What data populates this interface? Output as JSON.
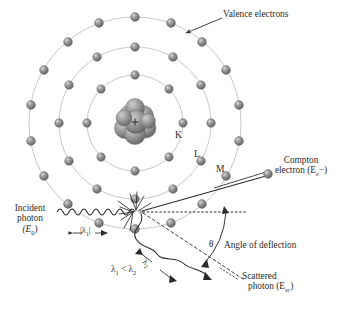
{
  "figure": {
    "width": 337,
    "height": 316,
    "background": "#ffffff",
    "ink_color": "#2b2b2b",
    "electron_color": "#8a8a8a",
    "orbit_color": "#b9b9b9"
  },
  "labels": {
    "valence_electrons": "Valence electrons",
    "shell_k": "K",
    "shell_l": "L",
    "shell_m": "M",
    "compton_line1": "Compton",
    "compton_line2_pre": "electron (E",
    "compton_line2_sub": "e",
    "compton_line2_post": "−)",
    "incident_line1": "Incident",
    "incident_line2": "photon",
    "incident_line3_pre": "(E",
    "incident_line3_sub": "0",
    "incident_line3_post": ")",
    "lambda1_marker_pre": "|λ",
    "lambda1_marker_sub": "1",
    "lambda1_marker_post": "|",
    "lambda2_marker_pre": "λ",
    "lambda2_marker_sub": "2",
    "lambda_compare_a": "λ",
    "lambda_compare_a_sub": "1",
    "lambda_compare_op": " < λ",
    "lambda_compare_b_sub": "2",
    "theta": "θ",
    "angle_of_deflection": "Angle of deflection",
    "scattered_line1": "Scattered",
    "scattered_line2_pre": "photon (E",
    "scattered_line2_sub": "sc",
    "scattered_line2_post": ")"
  },
  "diagram_data": {
    "type": "physics-schematic",
    "subject": "Compton scattering of an incident photon by an outer-shell (valence) electron",
    "atom": {
      "center_x": 135,
      "center_y": 123,
      "nucleus_radius": 21,
      "nucleus_charge_symbol": "+",
      "shells": [
        {
          "name": "K",
          "radius": 48,
          "electron_count": 8,
          "label_x": 178,
          "label_y": 136
        },
        {
          "name": "L",
          "radius": 76,
          "electron_count": 12,
          "label_x": 197,
          "label_y": 155
        },
        {
          "name": "M",
          "radius": 106,
          "electron_count": 18,
          "label_x": 219,
          "label_y": 170
        }
      ]
    },
    "interaction_point": {
      "x": 141,
      "y": 212
    },
    "incident_photon": {
      "energy_symbol": "E0",
      "wavelength_symbol": "lambda1",
      "direction": "left-to-right, horizontal",
      "wave_start_x": 57,
      "wave_end_x": 136,
      "wave_y": 212,
      "wave_amplitude": 5,
      "wave_cycles": 6.5
    },
    "compton_electron": {
      "energy_symbol": "Ee-",
      "direction": "up and to the right from interaction point",
      "angle_deg_above_horizontal": 22,
      "end_x": 268,
      "end_y": 176
    },
    "scattered_photon": {
      "energy_symbol": "Esc",
      "wavelength_symbol": "lambda2",
      "direction": "down and to the right from interaction point",
      "angle_deg_below_horizontal": 42,
      "end_x": 236,
      "end_y": 274,
      "wave_amplitude": 6,
      "wave_cycles": 4
    },
    "reference_axis": {
      "style": "dotted",
      "from_x": 141,
      "from_y": 212,
      "to_x": 247,
      "to_y": 212,
      "meaning": "original photon direction extended"
    },
    "deflection_angle": {
      "symbol": "theta",
      "measured_between": [
        "reference_axis",
        "scattered_photon"
      ],
      "approx_value_deg": 42,
      "arc_radius": 58
    },
    "wavelength_relation": "lambda1 < lambda2"
  }
}
